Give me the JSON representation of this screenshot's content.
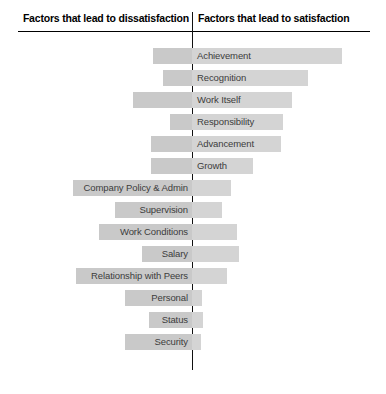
{
  "header": {
    "left_title": "Factors that lead to dissatisfaction",
    "right_title": "Factors that lead to satisfaction"
  },
  "colors": {
    "bar_dissatisfaction": "#c9c9c9",
    "bar_satisfaction": "#d4d4d4",
    "axis": "#111111",
    "label_text": "#3c3c3c",
    "header_text": "#000000",
    "background": "#ffffff"
  },
  "chart_data": {
    "type": "bar",
    "title": "",
    "orientation": "horizontal-diverging",
    "center_position_px": 192,
    "xlabel": "",
    "ylabel": "",
    "grid": false,
    "legend": "none",
    "axis_labels": {
      "left": "Factors that lead to dissatisfaction",
      "right": "Factors that lead to satisfaction"
    },
    "categories": [
      "Achievement",
      "Recognition",
      "Work Itself",
      "Responsibility",
      "Advancement",
      "Growth",
      "Company Policy & Admin",
      "Supervision",
      "Work Conditions",
      "Salary",
      "Relationship with Peers",
      "Personal",
      "Status",
      "Security"
    ],
    "series": [
      {
        "name": "Factors that lead to dissatisfaction",
        "side": "left",
        "values": [
          39,
          29,
          59,
          22,
          41,
          41,
          119,
          77,
          93,
          50,
          116,
          67,
          43,
          67
        ]
      },
      {
        "name": "Factors that lead to satisfaction",
        "side": "right",
        "values": [
          150,
          116,
          100,
          91,
          89,
          61,
          39,
          30,
          45,
          47,
          35,
          10,
          11,
          9
        ]
      }
    ],
    "bars": [
      {
        "label": "Achievement",
        "label_side": "right",
        "left_extent": 39,
        "right_extent": 150
      },
      {
        "label": "Recognition",
        "label_side": "right",
        "left_extent": 29,
        "right_extent": 116
      },
      {
        "label": "Work Itself",
        "label_side": "right",
        "left_extent": 59,
        "right_extent": 100
      },
      {
        "label": "Responsibility",
        "label_side": "right",
        "left_extent": 22,
        "right_extent": 91
      },
      {
        "label": "Advancement",
        "label_side": "right",
        "left_extent": 41,
        "right_extent": 89
      },
      {
        "label": "Growth",
        "label_side": "right",
        "left_extent": 41,
        "right_extent": 61
      },
      {
        "label": "Company Policy & Admin",
        "label_side": "left",
        "left_extent": 119,
        "right_extent": 39
      },
      {
        "label": "Supervision",
        "label_side": "left",
        "left_extent": 77,
        "right_extent": 30
      },
      {
        "label": "Work Conditions",
        "label_side": "left",
        "left_extent": 93,
        "right_extent": 45
      },
      {
        "label": "Salary",
        "label_side": "left",
        "left_extent": 50,
        "right_extent": 47
      },
      {
        "label": "Relationship with Peers",
        "label_side": "left",
        "left_extent": 116,
        "right_extent": 35
      },
      {
        "label": "Personal",
        "label_side": "left",
        "left_extent": 67,
        "right_extent": 10
      },
      {
        "label": "Status",
        "label_side": "left",
        "left_extent": 43,
        "right_extent": 11
      },
      {
        "label": "Security",
        "label_side": "left",
        "left_extent": 67,
        "right_extent": 9
      }
    ]
  }
}
